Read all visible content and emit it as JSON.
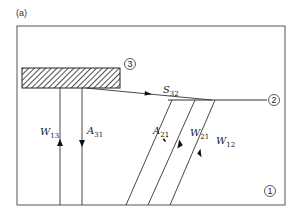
{
  "panel_label": "(a)",
  "surfaces": [
    {
      "id": "1",
      "label": "1",
      "description": "enclosure / floor surface"
    },
    {
      "id": "2",
      "label": "2",
      "description": "horizontal surface"
    },
    {
      "id": "3",
      "label": "3",
      "description": "hatched block"
    }
  ],
  "flux_labels": {
    "W13": {
      "main": "W",
      "sub": "13",
      "direction": "up"
    },
    "A31": {
      "main": "A",
      "sub": "31",
      "direction": "down"
    },
    "S32": {
      "main": "S",
      "sub": "32",
      "direction": "right"
    },
    "A21": {
      "main": "A",
      "sub": "21",
      "direction": "down-left"
    },
    "W21": {
      "main": "W",
      "sub": "21",
      "direction": "down-left"
    },
    "W12": {
      "main": "W",
      "sub": "12",
      "direction": "up-right"
    }
  },
  "colors": {
    "line": "#333333",
    "frame": "#555555",
    "hatch": "#222222"
  }
}
